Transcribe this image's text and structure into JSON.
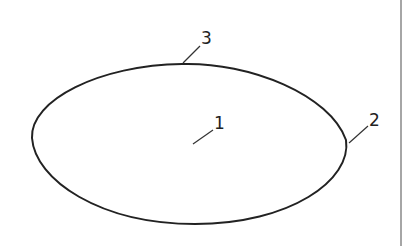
{
  "diagram": {
    "shape": "ellipse",
    "stroke_color": "#222222",
    "labels": [
      {
        "id": "1",
        "text": "1",
        "target": "interior"
      },
      {
        "id": "2",
        "text": "2",
        "target": "right-edge"
      },
      {
        "id": "3",
        "text": "3",
        "target": "top-edge"
      }
    ],
    "border_line_color": "#888888"
  }
}
